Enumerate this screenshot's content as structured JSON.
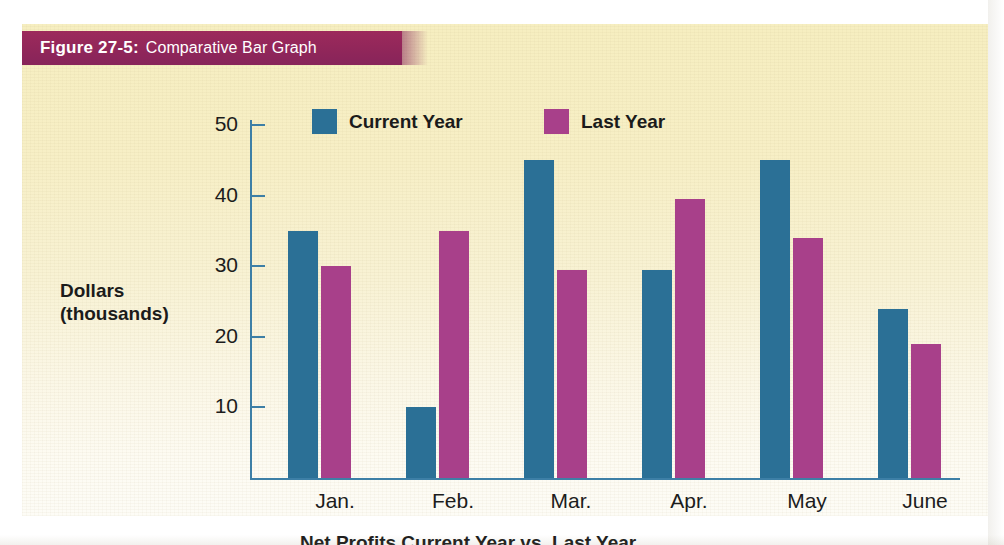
{
  "figure": {
    "number_label": "Figure 27-5:",
    "caption": "Comparative Bar Graph",
    "banner_color": "#93275a",
    "panel_color": "#f7efc6",
    "bottom_caption_partial": "Net Profits  Current Year vs. Last Year"
  },
  "legend": {
    "entries": [
      {
        "label": "Current Year",
        "color": "#2b7096"
      },
      {
        "label": "Last Year",
        "color": "#a8408a"
      }
    ]
  },
  "axis": {
    "y_title_line1": "Dollars",
    "y_title_line2": "(thousands)",
    "y_ticks": [
      "50",
      "40",
      "30",
      "20",
      "10"
    ],
    "axis_color": "#3d7fa6"
  },
  "chart_data": {
    "type": "bar",
    "title": "Figure 27-5: Comparative Bar Graph",
    "xlabel": "",
    "ylabel": "Dollars (thousands)",
    "ylim": [
      0,
      55
    ],
    "yticks": [
      10,
      20,
      30,
      40,
      50
    ],
    "grid": false,
    "legend_position": "top",
    "categories": [
      "Jan.",
      "Feb.",
      "Mar.",
      "Apr.",
      "May",
      "June"
    ],
    "series": [
      {
        "name": "Current Year",
        "color": "#2b7096",
        "values": [
          35,
          10,
          45,
          29.5,
          45,
          24
        ]
      },
      {
        "name": "Last Year",
        "color": "#a8408a",
        "values": [
          30,
          35,
          29.5,
          39.5,
          34,
          19
        ]
      }
    ]
  }
}
